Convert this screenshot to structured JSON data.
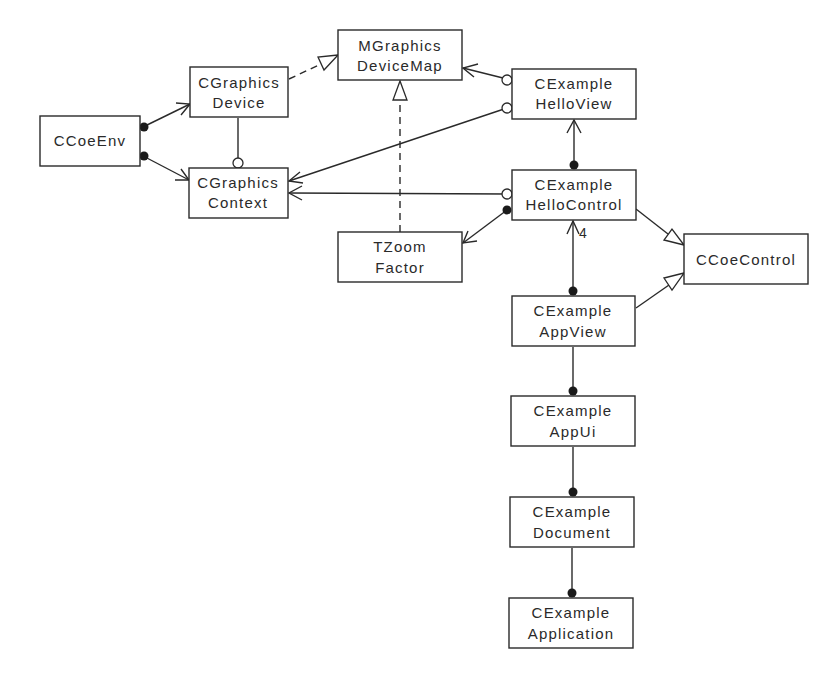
{
  "diagram": {
    "type": "UML class diagram",
    "colors": {
      "stroke": "#2a2a2a",
      "background": "#ffffff"
    },
    "classes": [
      {
        "id": "ccoeenv",
        "lines": [
          "CCoeEnv"
        ]
      },
      {
        "id": "cgraphicsdevice",
        "lines": [
          "CGraphics",
          "Device"
        ]
      },
      {
        "id": "cgraphicscontext",
        "lines": [
          "CGraphics",
          "Context"
        ]
      },
      {
        "id": "mgraphicsdevicemap",
        "lines": [
          "MGraphics",
          "DeviceMap"
        ]
      },
      {
        "id": "cexamplehelloview",
        "lines": [
          "CExample",
          "HelloView"
        ]
      },
      {
        "id": "cexamplehellocontrol",
        "lines": [
          "CExample",
          "HelloControl"
        ]
      },
      {
        "id": "tzoomfactor",
        "lines": [
          "TZoom",
          "Factor"
        ]
      },
      {
        "id": "ccoecontrol",
        "lines": [
          "CCoeControl"
        ]
      },
      {
        "id": "cexampleappview",
        "lines": [
          "CExample",
          "AppView"
        ]
      },
      {
        "id": "cexampleappui",
        "lines": [
          "CExample",
          "AppUi"
        ]
      },
      {
        "id": "cexampledocument",
        "lines": [
          "CExample",
          "Document"
        ]
      },
      {
        "id": "cexampleapplication",
        "lines": [
          "CExample",
          "Application"
        ]
      }
    ],
    "relationships": [
      {
        "from": "CCoeEnv",
        "to": "CGraphics Device",
        "kind": "owns (filled dot) navigable"
      },
      {
        "from": "CCoeEnv",
        "to": "CGraphics Context",
        "kind": "owns (filled dot) navigable"
      },
      {
        "from": "CGraphics Device",
        "to": "CGraphics Context",
        "kind": "uses (open circle)"
      },
      {
        "from": "CGraphics Device",
        "to": "MGraphics DeviceMap",
        "kind": "realizes (dashed, hollow triangle)"
      },
      {
        "from": "TZoom Factor",
        "to": "MGraphics DeviceMap",
        "kind": "realizes (dashed, hollow triangle)"
      },
      {
        "from": "CExample HelloView",
        "to": "MGraphics DeviceMap",
        "kind": "uses (open circle) navigable"
      },
      {
        "from": "CExample HelloView",
        "to": "CGraphics Context",
        "kind": "uses (open circle) navigable"
      },
      {
        "from": "CExample HelloControl",
        "to": "CExample HelloView",
        "kind": "owns (filled dot) navigable"
      },
      {
        "from": "CExample HelloControl",
        "to": "CGraphics Context",
        "kind": "uses (open circle) navigable"
      },
      {
        "from": "CExample HelloControl",
        "to": "TZoom Factor",
        "kind": "owns (filled dot) navigable"
      },
      {
        "from": "CExample HelloControl",
        "to": "CCoeControl",
        "kind": "inherits (hollow triangle)"
      },
      {
        "from": "CExample AppView",
        "to": "CExample HelloControl",
        "kind": "owns (filled dot) navigable",
        "multiplicity": "4"
      },
      {
        "from": "CExample AppView",
        "to": "CCoeControl",
        "kind": "inherits (hollow triangle)"
      },
      {
        "from": "CExample AppUi",
        "to": "CExample AppView",
        "kind": "owns (filled dot)"
      },
      {
        "from": "CExample Document",
        "to": "CExample AppUi",
        "kind": "owns (filled dot)"
      },
      {
        "from": "CExample Application",
        "to": "CExample Document",
        "kind": "owns (filled dot)"
      }
    ],
    "multiplicity_label": "4"
  }
}
